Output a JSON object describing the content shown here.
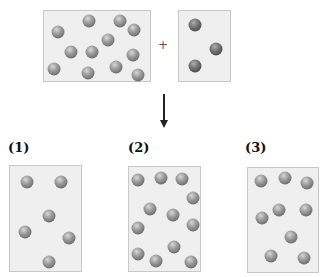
{
  "reactants": {
    "box_a": {
      "ball_count": 12,
      "balls": [
        [
          58,
          32
        ],
        [
          89,
          21
        ],
        [
          120,
          21
        ],
        [
          134,
          30
        ],
        [
          108,
          40
        ],
        [
          71,
          52
        ],
        [
          92,
          52
        ],
        [
          133,
          55
        ],
        [
          54,
          69
        ],
        [
          88,
          73
        ],
        [
          116,
          67
        ],
        [
          138,
          75
        ]
      ]
    },
    "operator": "+",
    "box_b": {
      "ball_count": 3,
      "balls": [
        [
          195,
          25
        ],
        [
          216,
          49
        ],
        [
          195,
          66
        ]
      ]
    }
  },
  "arrow": "↓",
  "options": [
    {
      "label": "(1)",
      "ball_count": 6,
      "balls": [
        [
          27,
          182
        ],
        [
          61,
          182
        ],
        [
          49,
          216
        ],
        [
          25,
          232
        ],
        [
          69,
          238
        ],
        [
          49,
          262
        ]
      ]
    },
    {
      "label": "(2)",
      "ball_count": 12,
      "balls": [
        [
          138,
          180
        ],
        [
          161,
          178
        ],
        [
          182,
          179
        ],
        [
          193,
          198
        ],
        [
          150,
          209
        ],
        [
          173,
          215
        ],
        [
          138,
          228
        ],
        [
          193,
          225
        ],
        [
          174,
          247
        ],
        [
          138,
          254
        ],
        [
          156,
          261
        ],
        [
          191,
          262
        ]
      ]
    },
    {
      "label": "(3)",
      "ball_count": 9,
      "balls": [
        [
          261,
          181
        ],
        [
          285,
          178
        ],
        [
          307,
          183
        ],
        [
          262,
          218
        ],
        [
          279,
          210
        ],
        [
          306,
          210
        ],
        [
          291,
          237
        ],
        [
          271,
          256
        ],
        [
          304,
          258
        ]
      ]
    }
  ],
  "colors": {
    "box_fill": "#efefef",
    "box_border": "#c8c8c8",
    "ball": "#7a7a7a"
  }
}
